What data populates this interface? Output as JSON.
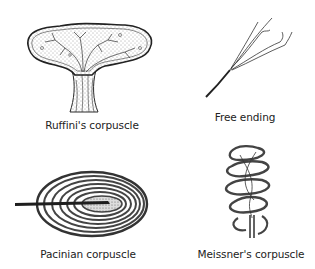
{
  "figure": {
    "type": "anatomical-diagram",
    "panels": [
      {
        "id": "ruffini",
        "label": "Ruffini's corpuscle",
        "position": "top-left"
      },
      {
        "id": "free-ending",
        "label": "Free ending",
        "position": "top-right"
      },
      {
        "id": "pacinian",
        "label": "Pacinian corpuscle",
        "position": "bottom-left"
      },
      {
        "id": "meissner",
        "label": "Meissner's corpuscle",
        "position": "bottom-right"
      }
    ]
  },
  "colors": {
    "background": "#ffffff",
    "ink": "#2a2a2a",
    "label": "#222222"
  }
}
